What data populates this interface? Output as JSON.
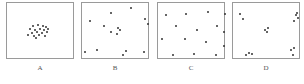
{
  "figure": {
    "panels": [
      {
        "label": "A",
        "pattern": "clustered",
        "left": 6,
        "dots": [
          [
            25,
            22
          ],
          [
            30,
            21
          ],
          [
            35,
            22
          ],
          [
            38,
            23
          ],
          [
            22,
            25
          ],
          [
            27,
            26
          ],
          [
            32,
            25
          ],
          [
            36,
            26
          ],
          [
            40,
            25
          ],
          [
            24,
            29
          ],
          [
            29,
            28
          ],
          [
            34,
            29
          ],
          [
            39,
            28
          ],
          [
            20,
            31
          ],
          [
            26,
            32
          ],
          [
            31,
            31
          ],
          [
            37,
            32
          ],
          [
            28,
            34
          ]
        ]
      },
      {
        "label": "B",
        "pattern": "random",
        "left": 81,
        "dots": [
          [
            48,
            4
          ],
          [
            28,
            9
          ],
          [
            7,
            17
          ],
          [
            62,
            15
          ],
          [
            65,
            20
          ],
          [
            21,
            22
          ],
          [
            35,
            24
          ],
          [
            37,
            26
          ],
          [
            28,
            28
          ],
          [
            34,
            30
          ],
          [
            2,
            48
          ],
          [
            14,
            46
          ],
          [
            40,
            51
          ],
          [
            43,
            47
          ],
          [
            61,
            48
          ]
        ]
      },
      {
        "label": "C",
        "pattern": "uniform",
        "left": 157,
        "dots": [
          [
            7,
            11
          ],
          [
            27,
            10
          ],
          [
            49,
            8
          ],
          [
            66,
            10
          ],
          [
            17,
            22
          ],
          [
            38,
            26
          ],
          [
            58,
            22
          ],
          [
            3,
            35
          ],
          [
            26,
            35
          ],
          [
            47,
            38
          ],
          [
            65,
            28
          ],
          [
            65,
            42
          ],
          [
            14,
            51
          ],
          [
            35,
            50
          ],
          [
            57,
            51
          ]
        ]
      },
      {
        "label": "D",
        "pattern": "regularly clustered",
        "left": 232,
        "dots": [
          [
            6,
            10
          ],
          [
            9,
            15
          ],
          [
            62,
            11
          ],
          [
            64,
            14
          ],
          [
            60,
            17
          ],
          [
            63,
            9
          ],
          [
            31,
            26
          ],
          [
            34,
            24
          ],
          [
            33,
            28
          ],
          [
            12,
            51
          ],
          [
            15,
            49
          ],
          [
            18,
            50
          ],
          [
            57,
            46
          ],
          [
            60,
            44
          ],
          [
            59,
            51
          ]
        ]
      }
    ]
  }
}
